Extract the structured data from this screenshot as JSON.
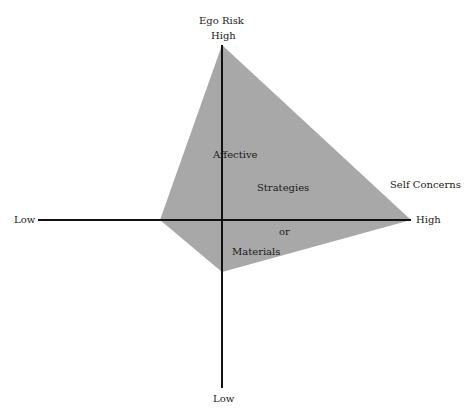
{
  "diagram": {
    "vertical_axis": {
      "title": "Ego Risk",
      "high_label": "High",
      "low_label": "Low"
    },
    "horizontal_axis": {
      "title": "Self Concerns",
      "high_label": "High",
      "low_label": "Low"
    },
    "region": {
      "labels": [
        "Affective",
        "Strategies",
        "or",
        "Materials"
      ],
      "fill_color": "#a8a8a8"
    },
    "axis_color": "#111111"
  }
}
